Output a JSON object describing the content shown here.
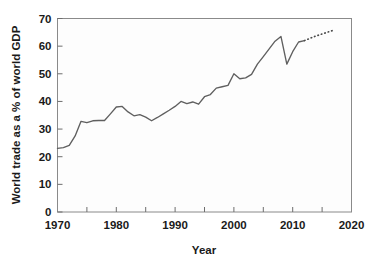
{
  "chart_data": {
    "type": "line",
    "title": "",
    "xlabel": "Year",
    "ylabel": "World trade as a % of world GDP",
    "xlim": [
      1970,
      2020
    ],
    "ylim": [
      0,
      70
    ],
    "grid": false,
    "legend": "none",
    "x_major_ticks": [
      1970,
      1980,
      1990,
      2000,
      2010,
      2020
    ],
    "x_major_tick_labels": [
      "1970",
      "1980",
      "1990",
      "2000",
      "2010",
      "2020"
    ],
    "x_minor_ticks": [
      1975,
      1985,
      1995,
      2005,
      2015
    ],
    "y_ticks": [
      0,
      10,
      20,
      30,
      40,
      50,
      60,
      70
    ],
    "y_tick_labels": [
      "0",
      "10",
      "20",
      "30",
      "40",
      "50",
      "60",
      "70"
    ],
    "series": [
      {
        "name": "World trade (historical)",
        "style": "solid",
        "color": "#5f5f5f",
        "x": [
          1970,
          1971,
          1972,
          1973,
          1974,
          1975,
          1976,
          1977,
          1978,
          1979,
          1980,
          1981,
          1982,
          1983,
          1984,
          1985,
          1986,
          1987,
          1988,
          1989,
          1990,
          1991,
          1992,
          1993,
          1994,
          1995,
          1996,
          1997,
          1998,
          1999,
          2000,
          2001,
          2002,
          2003,
          2004,
          2005,
          2006,
          2007,
          2008,
          2009,
          2010,
          2011,
          2012
        ],
        "values": [
          23.0,
          23.3,
          24.1,
          27.5,
          32.8,
          32.3,
          33.0,
          33.1,
          33.1,
          35.5,
          38.0,
          38.2,
          36.2,
          34.8,
          35.2,
          34.3,
          33.0,
          34.2,
          35.5,
          36.8,
          38.2,
          40.0,
          39.2,
          39.8,
          39.0,
          41.7,
          42.5,
          44.8,
          45.3,
          45.8,
          50.0,
          48.2,
          48.5,
          49.8,
          53.5,
          56.2,
          59.0,
          61.8,
          63.5,
          53.5,
          58.0,
          61.5,
          62.0
        ]
      },
      {
        "name": "World trade (projection)",
        "style": "dotted",
        "color": "#4a4a4a",
        "x": [
          2012,
          2013,
          2014,
          2015,
          2016,
          2017
        ],
        "values": [
          62.0,
          62.9,
          63.7,
          64.4,
          65.1,
          65.8
        ]
      }
    ]
  }
}
